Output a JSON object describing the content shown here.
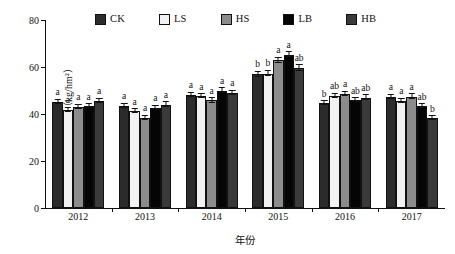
{
  "chart_data": {
    "type": "bar",
    "title": "",
    "xlabel": "年份",
    "ylabel": "磷素吸收量/（kg/hm²）",
    "ylim": [
      0,
      80
    ],
    "yticks": [
      0,
      20,
      40,
      60,
      80
    ],
    "grid": false,
    "legend_position": "top",
    "categories": [
      "2012",
      "2013",
      "2014",
      "2015",
      "2016",
      "2017"
    ],
    "series": [
      {
        "name": "CK",
        "color": "#2b2b2b",
        "values": [
          45.2,
          43.6,
          48.2,
          57.0,
          44.6,
          47.2
        ],
        "errors": [
          2.2,
          2.0,
          2.2,
          2.5,
          2.0,
          2.2
        ],
        "sig": [
          "a",
          "a",
          "a",
          "b",
          "b",
          "a"
        ]
      },
      {
        "name": "LS",
        "color": "#f2f2f2",
        "values": [
          41.8,
          41.2,
          47.6,
          57.2,
          47.6,
          45.6
        ],
        "errors": [
          2.2,
          2.0,
          2.0,
          2.8,
          2.2,
          2.2
        ],
        "sig": [
          "a",
          "a",
          "a",
          "b",
          "ab",
          "a"
        ]
      },
      {
        "name": "HS",
        "color": "#8c8c8c",
        "values": [
          43.0,
          38.4,
          45.8,
          62.8,
          48.6,
          47.4
        ],
        "errors": [
          2.0,
          1.8,
          2.2,
          2.8,
          2.0,
          2.5
        ],
        "sig": [
          "a",
          "a",
          "a",
          "a",
          "a",
          "a"
        ]
      },
      {
        "name": "LB",
        "color": "#050505",
        "values": [
          43.4,
          42.6,
          50.0,
          65.2,
          45.8,
          43.2
        ],
        "errors": [
          1.8,
          2.0,
          2.4,
          2.5,
          2.0,
          2.0
        ],
        "sig": [
          "a",
          "a",
          "a",
          "a",
          "ab",
          "ab"
        ]
      },
      {
        "name": "HB",
        "color": "#3a3a3a",
        "values": [
          45.6,
          44.0,
          49.0,
          59.6,
          47.0,
          38.2
        ],
        "errors": [
          2.2,
          2.2,
          2.2,
          2.8,
          2.2,
          2.0
        ],
        "sig": [
          "a",
          "a",
          "a",
          "ab",
          "ab",
          "b"
        ]
      }
    ]
  }
}
